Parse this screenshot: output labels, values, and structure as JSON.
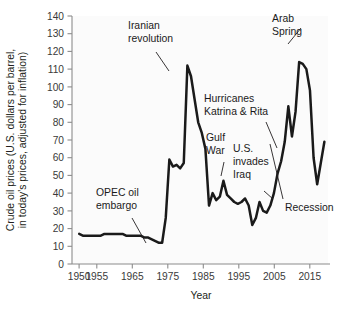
{
  "chart_data": {
    "type": "line",
    "title": "",
    "xlabel": "Year",
    "ylabel_line1": "Crude oil prices (U.S. dollars per barrel,",
    "ylabel_line2": "in today's prices, adjusted for inflation)",
    "xlim": [
      1948,
      2019
    ],
    "ylim": [
      0,
      140
    ],
    "ytick_step": 10,
    "yticks": [
      0,
      10,
      20,
      30,
      40,
      50,
      60,
      70,
      80,
      90,
      100,
      110,
      120,
      130,
      140
    ],
    "xticks": [
      1950,
      1955,
      1965,
      1975,
      1985,
      1995,
      2005,
      2015
    ],
    "xtick_labels": [
      "1950",
      "1955",
      "1965",
      "1975",
      "1985",
      "1995",
      "2005",
      "2015"
    ],
    "grid": false,
    "legend_position": "none",
    "line_color": "#1a1a1a",
    "series": [
      {
        "name": "Crude oil price (inflation adjusted, USD per barrel)",
        "x": [
          1950,
          1951,
          1952,
          1953,
          1954,
          1955,
          1956,
          1957,
          1958,
          1959,
          1960,
          1961,
          1962,
          1963,
          1964,
          1965,
          1966,
          1967,
          1968,
          1969,
          1970,
          1971,
          1972,
          1973,
          1974,
          1975,
          1976,
          1977,
          1978,
          1979,
          1980,
          1981,
          1982,
          1983,
          1984,
          1985,
          1986,
          1987,
          1988,
          1989,
          1990,
          1991,
          1992,
          1993,
          1994,
          1995,
          1996,
          1997,
          1998,
          1999,
          2000,
          2001,
          2002,
          2003,
          2004,
          2005,
          2006,
          2007,
          2008,
          2009,
          2010,
          2011,
          2012,
          2013,
          2014,
          2015,
          2016,
          2017,
          2018
        ],
        "values": [
          17,
          16,
          16,
          16,
          16,
          16,
          16,
          17,
          17,
          17,
          17,
          17,
          17,
          16,
          16,
          16,
          16,
          16,
          15,
          15,
          14,
          13,
          12,
          12,
          26,
          59,
          55,
          56,
          54,
          57,
          112,
          106,
          93,
          80,
          74,
          65,
          33,
          40,
          36,
          38,
          47,
          39,
          37,
          35,
          34,
          35,
          37,
          33,
          22,
          26,
          35,
          30,
          29,
          33,
          40,
          51,
          58,
          69,
          89,
          72,
          86,
          114,
          113,
          110,
          98,
          60,
          45,
          57,
          69
        ],
        "notable_points": [
          {
            "year": 1950,
            "value": 17
          },
          {
            "year": 1970,
            "value": 14
          },
          {
            "year": 1973,
            "value": 12
          },
          {
            "year": 1975,
            "value": 59
          },
          {
            "year": 1980,
            "value": 112
          },
          {
            "year": 1986,
            "value": 33
          },
          {
            "year": 1990,
            "value": 47
          },
          {
            "year": 1998,
            "value": 22
          },
          {
            "year": 2008,
            "value": 114
          },
          {
            "year": 2009,
            "value": 72
          },
          {
            "year": 2012,
            "value": 124
          },
          {
            "year": 2016,
            "value": 45
          },
          {
            "year": 2018,
            "value": 69
          }
        ]
      }
    ],
    "annotations": [
      {
        "id": "iranian-revolution",
        "text_line1": "Iranian",
        "text_line2": "revolution",
        "target_year": 1980,
        "target_value": 112
      },
      {
        "id": "arab-spring",
        "text_line1": "Arab",
        "text_line2": "Spring",
        "target_year": 2012,
        "target_value": 124
      },
      {
        "id": "hurricanes-katrina-rita",
        "text_line1": "Hurricanes",
        "text_line2": "Katrina & Rita",
        "target_year": 2005,
        "target_value": 58
      },
      {
        "id": "gulf-war",
        "text_line1": "Gulf",
        "text_line2": "War",
        "target_year": 1990,
        "target_value": 47
      },
      {
        "id": "us-invades-iraq",
        "text_line1": "U.S.",
        "text_line2": "invades",
        "text_line3": "Iraq",
        "target_year": 2003,
        "target_value": 36
      },
      {
        "id": "opec-oil-embargo",
        "text_line1": "OPEC oil",
        "text_line2": "embargo",
        "target_year": 1973,
        "target_value": 13
      },
      {
        "id": "recession",
        "text_line1": "Recession",
        "target_year": 2009,
        "target_value": 74
      }
    ]
  },
  "figure": {
    "xlabel": "Year",
    "ylabel_line1": "Crude oil prices (U.S. dollars per barrel,",
    "ylabel_line2": "in today's prices, adjusted for inflation)",
    "ytick_0": "0",
    "ytick_10": "10",
    "ytick_20": "20",
    "ytick_30": "30",
    "ytick_40": "40",
    "ytick_50": "50",
    "ytick_60": "60",
    "ytick_70": "70",
    "ytick_80": "80",
    "ytick_90": "90",
    "ytick_100": "100",
    "ytick_110": "110",
    "ytick_120": "120",
    "ytick_130": "130",
    "ytick_140": "140",
    "xtick_1950": "1950",
    "xtick_1955": "1955",
    "xtick_1965": "1965",
    "xtick_1975": "1975",
    "xtick_1985": "1985",
    "xtick_1995": "1995",
    "xtick_2005": "2005",
    "xtick_2015": "2015",
    "ann_iranian_1": "Iranian",
    "ann_iranian_2": "revolution",
    "ann_arab_1": "Arab",
    "ann_arab_2": "Spring",
    "ann_hurricanes_1": "Hurricanes",
    "ann_hurricanes_2": "Katrina & Rita",
    "ann_gulf_1": "Gulf",
    "ann_gulf_2": "War",
    "ann_iraq_1": "U.S.",
    "ann_iraq_2": "invades",
    "ann_iraq_3": "Iraq",
    "ann_opec_1": "OPEC oil",
    "ann_opec_2": "embargo",
    "ann_recession": "Recession"
  }
}
